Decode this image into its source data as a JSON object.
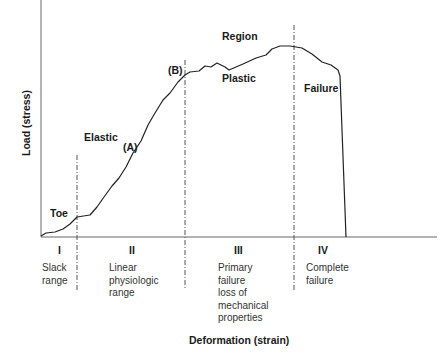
{
  "chart_data": {
    "type": "line",
    "title": "",
    "xlabel": "Deformation (strain)",
    "ylabel": "Load (stress)",
    "grid": false,
    "curve_points_px": [
      [
        41,
        236
      ],
      [
        46,
        233
      ],
      [
        55,
        232
      ],
      [
        63,
        229
      ],
      [
        70,
        224
      ],
      [
        77,
        217
      ],
      [
        90,
        215
      ],
      [
        97,
        207
      ],
      [
        104,
        197
      ],
      [
        112,
        186
      ],
      [
        119,
        178
      ],
      [
        126,
        167
      ],
      [
        133,
        153
      ],
      [
        141,
        141
      ],
      [
        148,
        125
      ],
      [
        155,
        113
      ],
      [
        163,
        100
      ],
      [
        170,
        93
      ],
      [
        178,
        82
      ],
      [
        185,
        75
      ],
      [
        190,
        72
      ],
      [
        199,
        71
      ],
      [
        205,
        66
      ],
      [
        211,
        67
      ],
      [
        217,
        63
      ],
      [
        225,
        67
      ],
      [
        229,
        70
      ],
      [
        243,
        64
      ],
      [
        256,
        58
      ],
      [
        266,
        55
      ],
      [
        272,
        49
      ],
      [
        280,
        46
      ],
      [
        290,
        46
      ],
      [
        302,
        48
      ],
      [
        312,
        54
      ],
      [
        322,
        62
      ],
      [
        331,
        65
      ],
      [
        338,
        70
      ],
      [
        340,
        76
      ],
      [
        346,
        237
      ]
    ],
    "region_boundaries_px_x": [
      77,
      185,
      294
    ],
    "annotations": [
      "Toe",
      "Elastic",
      "(A)",
      "(B)",
      "Region",
      "Plastic",
      "Failure"
    ],
    "regions": [
      {
        "numeral": "I",
        "description": [
          "Slack",
          "range"
        ]
      },
      {
        "numeral": "II",
        "description": [
          "Linear",
          "physiologic",
          "range"
        ]
      },
      {
        "numeral": "III",
        "description": [
          "Primary",
          "failure",
          "loss of",
          "mechanical",
          "properties"
        ]
      },
      {
        "numeral": "IV",
        "description": [
          "Complete",
          "failure"
        ]
      }
    ]
  },
  "labels": {
    "toe": "Toe",
    "elastic": "Elastic",
    "point_a": "(A)",
    "point_b": "(B)",
    "region": "Region",
    "plastic": "Plastic",
    "failure": "Failure",
    "x_axis": "Deformation (strain)",
    "y_axis": "Load (stress)"
  },
  "regions": {
    "r1": {
      "numeral": "I",
      "line1": "Slack",
      "line2": "range"
    },
    "r2": {
      "numeral": "II",
      "line1": "Linear",
      "line2": "physiologic",
      "line3": "range"
    },
    "r3": {
      "numeral": "III",
      "line1": "Primary",
      "line2": "failure",
      "line3": "loss of",
      "line4": "mechanical",
      "line5": "properties"
    },
    "r4": {
      "numeral": "IV",
      "line1": "Complete",
      "line2": "failure"
    }
  },
  "colors": {
    "axis": "#555555",
    "curve": "#222222",
    "dashed": "#555555",
    "text": "#1a1a1a"
  }
}
